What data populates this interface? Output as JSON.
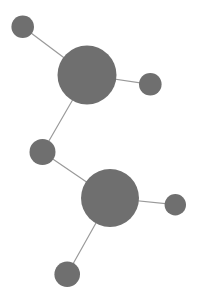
{
  "figure": {
    "kind": "node-link-graph",
    "width": 199,
    "height": 305,
    "background_color": "#ffffff"
  },
  "style": {
    "node_fill": "#6f6f6f",
    "edge_stroke": "#9a9a9a",
    "edge_width": 1.2
  },
  "graph": {
    "nodes": [
      {
        "id": "n1",
        "label": "",
        "cx": 22.7,
        "cy": 26.8,
        "r": 11.3,
        "size_class": "small",
        "color": "#6f6f6f"
      },
      {
        "id": "n2",
        "label": "",
        "cx": 87.0,
        "cy": 75.0,
        "r": 29.5,
        "size_class": "large",
        "color": "#6f6f6f"
      },
      {
        "id": "n3",
        "label": "",
        "cx": 150.3,
        "cy": 84.3,
        "r": 11.3,
        "size_class": "small",
        "color": "#6f6f6f"
      },
      {
        "id": "n4",
        "label": "",
        "cx": 42.5,
        "cy": 152.0,
        "r": 13.0,
        "size_class": "medium",
        "color": "#6f6f6f"
      },
      {
        "id": "n5",
        "label": "",
        "cx": 110.0,
        "cy": 198.0,
        "r": 29.0,
        "size_class": "large",
        "color": "#6f6f6f"
      },
      {
        "id": "n6",
        "label": "",
        "cx": 175.3,
        "cy": 204.7,
        "r": 10.7,
        "size_class": "small",
        "color": "#6f6f6f"
      },
      {
        "id": "n7",
        "label": "",
        "cx": 67.2,
        "cy": 274.2,
        "r": 12.8,
        "size_class": "medium",
        "color": "#6f6f6f"
      }
    ],
    "edges": [
      {
        "id": "e1",
        "source": "n1",
        "target": "n2",
        "x1": 22.7,
        "y1": 26.8,
        "x2": 87.0,
        "y2": 75.0
      },
      {
        "id": "e2",
        "source": "n2",
        "target": "n3",
        "x1": 87.0,
        "y1": 75.0,
        "x2": 150.3,
        "y2": 84.3
      },
      {
        "id": "e3",
        "source": "n2",
        "target": "n4",
        "x1": 87.0,
        "y1": 75.0,
        "x2": 42.5,
        "y2": 152.0
      },
      {
        "id": "e4",
        "source": "n4",
        "target": "n5",
        "x1": 42.5,
        "y1": 152.0,
        "x2": 110.0,
        "y2": 198.0
      },
      {
        "id": "e5",
        "source": "n5",
        "target": "n6",
        "x1": 110.0,
        "y1": 198.0,
        "x2": 175.3,
        "y2": 204.7
      },
      {
        "id": "e6",
        "source": "n5",
        "target": "n7",
        "x1": 110.0,
        "y1": 198.0,
        "x2": 67.2,
        "y2": 274.2
      }
    ]
  }
}
